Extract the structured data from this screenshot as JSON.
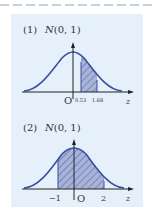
{
  "colors": {
    "panel_bg": "#e6f0fa",
    "curve": "#3a4fa0",
    "shade_fill": "#9aa6d0",
    "hatch": "#3a4fa0",
    "axis": "#222222",
    "dash": "#b8c2cc"
  },
  "panels": [
    {
      "index_label": "(1)",
      "dist_label": "N(0, 1)",
      "shaded_from": 0.53,
      "shaded_to": 1.68,
      "tick_labels": [
        "0.53",
        "1.68"
      ],
      "origin_label": "O",
      "axis_label": "z"
    },
    {
      "index_label": "(2)",
      "dist_label": "N(0, 1)",
      "shaded_from": -1,
      "shaded_to": 2,
      "tick_labels": [
        "−1",
        "2"
      ],
      "origin_label": "O",
      "axis_label": "z"
    }
  ]
}
